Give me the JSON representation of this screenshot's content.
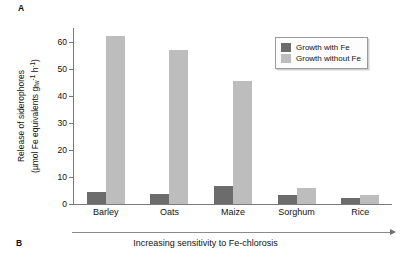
{
  "panels": {
    "a_label": "A",
    "b_label": "B"
  },
  "legend": {
    "position": "top-right",
    "items": [
      {
        "label": "Growth with Fe",
        "color": "#6c6c6c"
      },
      {
        "label": "Growth without Fe",
        "color": "#bdbdbd"
      }
    ]
  },
  "axis": {
    "y_title_line1": "Release of siderophores",
    "y_title_line2_pre": "(µmol Fe equivalents g",
    "y_title_sub": "fw",
    "y_title_sup1": "-1",
    "y_title_mid": " h",
    "y_title_sup2": "-1",
    "y_title_post": ")",
    "ticks": [
      "0",
      "10",
      "20",
      "30",
      "40",
      "50",
      "60"
    ]
  },
  "footer": {
    "arrow_caption": "Increasing sensitivity to Fe-chlorosis"
  },
  "chart_data": {
    "type": "bar",
    "title": "",
    "xlabel": "Increasing sensitivity to Fe-chlorosis",
    "ylabel": "Release of siderophores (µmol Fe equivalents g fw-1 h-1)",
    "categories": [
      "Barley",
      "Oats",
      "Maize",
      "Sorghum",
      "Rice"
    ],
    "series": [
      {
        "name": "Growth with Fe",
        "color": "#6c6c6c",
        "values": [
          4.6,
          3.7,
          6.8,
          3.5,
          2.1
        ]
      },
      {
        "name": "Growth without Fe",
        "color": "#bdbdbd",
        "values": [
          62.0,
          57.0,
          45.3,
          6.0,
          3.2
        ]
      }
    ],
    "ylim": [
      0,
      65
    ],
    "yticks": [
      0,
      10,
      20,
      30,
      40,
      50,
      60
    ],
    "grid": false,
    "legend_position": "top-right"
  }
}
